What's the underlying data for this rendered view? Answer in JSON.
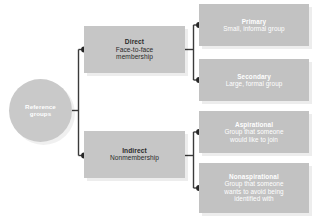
{
  "diagram": {
    "colors": {
      "background": "#ffffff",
      "root_fill": "#c9c9c9",
      "level1_fill": "#c6c6c6",
      "level2_fill": "#c2c2c2",
      "connector": "#3a3a3a",
      "dark_text": "#2b2b2b",
      "light_text": "#ffffff"
    },
    "root": {
      "title": "Reference",
      "desc": "groups"
    },
    "level1": [
      {
        "id": "direct",
        "title": "Direct",
        "desc_line1": "Face-to-face",
        "desc_line2": "membership"
      },
      {
        "id": "indirect",
        "title": "Indirect",
        "desc_line1": "Nonmembership",
        "desc_line2": ""
      }
    ],
    "level2": [
      {
        "id": "primary",
        "parent": "direct",
        "title": "Primary",
        "desc_line1": "Small, informal group",
        "desc_line2": "",
        "desc_line3": ""
      },
      {
        "id": "secondary",
        "parent": "direct",
        "title": "Secondary",
        "desc_line1": "Large, formal group",
        "desc_line2": "",
        "desc_line3": ""
      },
      {
        "id": "aspirational",
        "parent": "indirect",
        "title": "Aspirational",
        "desc_line1": "Group that someone",
        "desc_line2": "would like to join",
        "desc_line3": ""
      },
      {
        "id": "nonaspirational",
        "parent": "indirect",
        "title": "Nonaspirational",
        "desc_line1": "Group that someone",
        "desc_line2": "wants to avoid being",
        "desc_line3": "identified with"
      }
    ]
  }
}
